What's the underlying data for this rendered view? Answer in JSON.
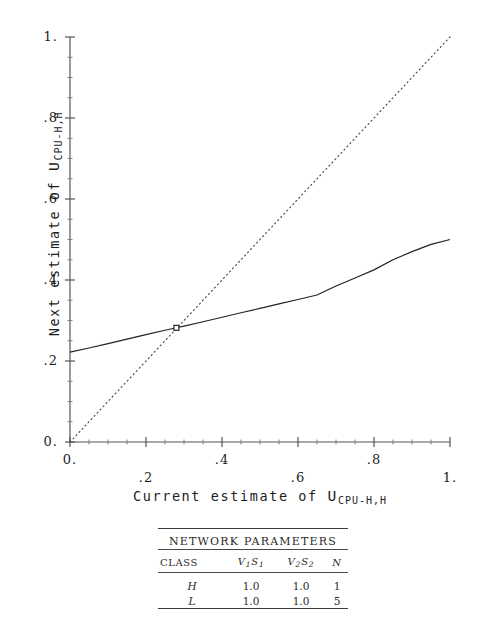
{
  "chart_data": {
    "type": "line",
    "title": "",
    "xlabel_parts": {
      "prefix": "Current estimate of ",
      "symbol": "U",
      "subscript": "CPU-H,H"
    },
    "ylabel_parts": {
      "prefix": "Next estimate of ",
      "symbol": "U",
      "subscript": "CPU-H,H"
    },
    "xlabel": "Current estimate of U_CPU-H,H",
    "ylabel": "Next estimate of U_CPU-H,H",
    "xlim": [
      0,
      1
    ],
    "ylim": [
      0,
      1
    ],
    "grid": false,
    "legend": "none",
    "xticks": [
      "0.",
      ".2",
      ".4",
      ".6",
      ".8",
      "1."
    ],
    "yticks": [
      "0.",
      ".2",
      ".4",
      ".6",
      ".8",
      "1."
    ],
    "xtick_values": [
      0,
      0.2,
      0.4,
      0.6,
      0.8,
      1.0
    ],
    "ytick_values": [
      0,
      0.2,
      0.4,
      0.6,
      0.8,
      1.0
    ],
    "series": [
      {
        "name": "next-estimate-curve",
        "style": "solid",
        "x": [
          0.0,
          0.05,
          0.1,
          0.15,
          0.2,
          0.25,
          0.28,
          0.3,
          0.35,
          0.4,
          0.45,
          0.5,
          0.55,
          0.6,
          0.65,
          0.7,
          0.75,
          0.8,
          0.85,
          0.9,
          0.95,
          1.0
        ],
        "y": [
          0.222,
          0.232,
          0.243,
          0.254,
          0.265,
          0.276,
          0.282,
          0.286,
          0.297,
          0.308,
          0.319,
          0.33,
          0.341,
          0.352,
          0.363,
          0.385,
          0.405,
          0.425,
          0.45,
          0.47,
          0.488,
          0.5
        ]
      },
      {
        "name": "identity-line",
        "style": "dotted",
        "x": [
          0.0,
          1.0
        ],
        "y": [
          0.0,
          1.0
        ]
      }
    ],
    "markers": [
      {
        "name": "fixed-point",
        "shape": "square",
        "x": 0.28,
        "y": 0.282
      }
    ],
    "annotations": []
  },
  "table": {
    "caption": "NETWORK PARAMETERS",
    "columns": [
      {
        "label": "CLASS"
      },
      {
        "base": "V",
        "sub1": "1",
        "base2": "S",
        "sub2": "1"
      },
      {
        "base": "V",
        "sub1": "2",
        "base2": "S",
        "sub2": "2"
      },
      {
        "label": "N"
      }
    ],
    "column_labels": [
      "CLASS",
      "V1S1",
      "V2S2",
      "N"
    ],
    "rows": [
      {
        "class": "H",
        "v1s1": "1.0",
        "v2s2": "1.0",
        "n": "1"
      },
      {
        "class": "L",
        "v1s1": "1.0",
        "v2s2": "1.0",
        "n": "5"
      }
    ]
  },
  "colors": {
    "ink": "#1d1d1d",
    "axis": "#555555",
    "curve": "#222222",
    "dotted": "#444444",
    "background": "#ffffff"
  }
}
